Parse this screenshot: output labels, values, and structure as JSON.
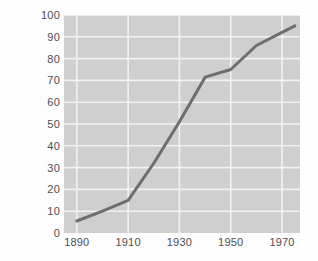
{
  "chart_data": {
    "type": "line",
    "title": "",
    "xlabel": "",
    "ylabel": "Percent of 14- to 17-year-olds\nenrolled in school",
    "xlim": [
      1885,
      1977
    ],
    "ylim": [
      0,
      100
    ],
    "grid": true,
    "legend": false,
    "x_ticks": [
      "1890",
      "1910",
      "1930",
      "1950",
      "1970"
    ],
    "x_tick_values": [
      1890,
      1910,
      1930,
      1950,
      1970
    ],
    "y_ticks": [
      "0",
      "10",
      "20",
      "30",
      "40",
      "50",
      "60",
      "70",
      "80",
      "90",
      "100"
    ],
    "y_tick_values": [
      0,
      10,
      20,
      30,
      40,
      50,
      60,
      70,
      80,
      90,
      100
    ],
    "series": [
      {
        "name": "Percent of 14- to 17-year-olds enrolled in school",
        "color": "#6e6e6e",
        "x": [
          1890,
          1900,
          1910,
          1920,
          1930,
          1940,
          1950,
          1960,
          1970,
          1975
        ],
        "values": [
          5.5,
          10,
          15,
          32,
          51,
          71.5,
          75,
          86,
          92,
          95
        ]
      }
    ],
    "colors": {
      "plot_background": "#cfcfcf",
      "gridline": "#f2f2f2",
      "line": "#6e6e6e",
      "text": "#4f4f4f",
      "page_background": "#fdfdfd"
    }
  },
  "caption": {
    "sliver_text": ""
  }
}
